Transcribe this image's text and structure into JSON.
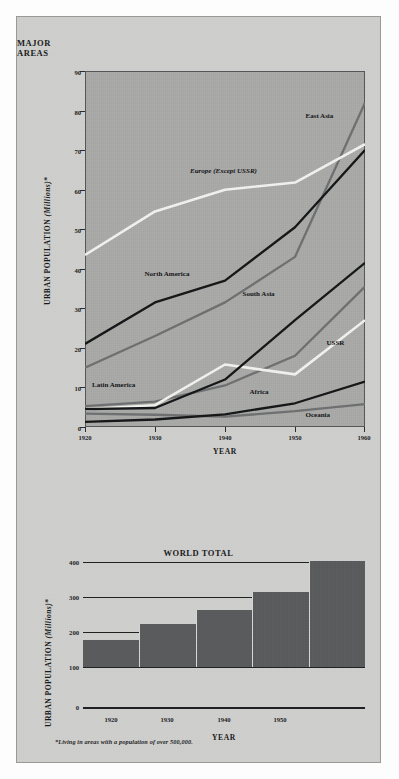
{
  "figure": {
    "footnote": "*Living in areas with a population of over 500,000.",
    "plate_color": "#cfcfcd",
    "plot_color": "#a9a9a7",
    "bar_color": "#585a5c"
  },
  "chart_data": [
    {
      "type": "line",
      "title": "MAJOR AREAS",
      "xlabel": "YEAR",
      "ylabel": "URBAN POPULATION (Millions)*",
      "x": [
        1920,
        1930,
        1940,
        1950,
        1960
      ],
      "xticklabels": [
        "1920",
        "1930",
        "1940",
        "1950",
        "1960"
      ],
      "xlim": [
        1920,
        1960
      ],
      "ylim": [
        0,
        90
      ],
      "yticks": [
        0,
        10,
        20,
        30,
        40,
        50,
        60,
        70,
        80,
        90
      ],
      "yticklabels": [
        "0",
        "10",
        "20",
        "30",
        "40",
        "50",
        "60",
        "70",
        "80",
        "90"
      ],
      "grid": false,
      "legend": "inline-annotations",
      "series": [
        {
          "name": "Europe (Except USSR)",
          "color": "#f2f2ee",
          "style": "white",
          "values": [
            43.5,
            54.5,
            60.0,
            61.8,
            71.5
          ]
        },
        {
          "name": "East Asia",
          "color": "#6e6f71",
          "style": "gray",
          "values": [
            15.0,
            23.0,
            31.5,
            43.0,
            82.0
          ]
        },
        {
          "name": "North America",
          "color": "#141517",
          "style": "black",
          "values": [
            21.0,
            31.5,
            37.0,
            50.5,
            70.0
          ]
        },
        {
          "name": "South Asia",
          "color": "#141517",
          "style": "black",
          "values": [
            4.5,
            4.8,
            12.0,
            27.0,
            41.5
          ]
        },
        {
          "name": "USSR",
          "color": "#f2f2ee",
          "style": "white",
          "values": [
            4.5,
            5.5,
            15.8,
            13.3,
            27.0
          ]
        },
        {
          "name": "Latin America",
          "color": "#6e6f71",
          "style": "gray",
          "values": [
            5.3,
            6.4,
            10.5,
            18.0,
            35.5
          ]
        },
        {
          "name": "Africa",
          "color": "#141517",
          "style": "black",
          "values": [
            1.3,
            1.9,
            3.2,
            6.0,
            11.5
          ]
        },
        {
          "name": "Oceania",
          "color": "#6e6f71",
          "style": "gray",
          "values": [
            3.4,
            3.1,
            2.6,
            4.0,
            5.8
          ]
        }
      ],
      "annotations": [
        {
          "text": "East Asia",
          "x": 1951.5,
          "y": 78.5,
          "italic": false
        },
        {
          "text": "Europe (Except USSR)",
          "x": 1935.0,
          "y": 64.5,
          "italic": true
        },
        {
          "text": "North America",
          "x": 1928.5,
          "y": 38.5,
          "italic": false
        },
        {
          "text": "South Asia",
          "x": 1942.5,
          "y": 33.5,
          "italic": false
        },
        {
          "text": "USSR",
          "x": 1954.5,
          "y": 21.0,
          "italic": false
        },
        {
          "text": "Latin America",
          "x": 1921.0,
          "y": 10.5,
          "italic": false
        },
        {
          "text": "Africa",
          "x": 1943.5,
          "y": 8.5,
          "italic": false
        },
        {
          "text": "Oceania",
          "x": 1951.5,
          "y": 2.8,
          "italic": false
        }
      ]
    },
    {
      "type": "bar",
      "title": "WORLD TOTAL",
      "xlabel": "YEAR",
      "ylabel": "URBAN POPULATION (Millions)*",
      "categories": [
        "1920",
        "1930",
        "1940",
        "1950",
        "1960"
      ],
      "xticklabels": [
        "1920",
        "1930",
        "1940",
        "1950"
      ],
      "values": [
        178,
        222,
        263,
        313,
        403
      ],
      "ylim": [
        0,
        400
      ],
      "yticks": [
        0,
        100,
        200,
        300,
        400
      ],
      "yticklabels": [
        "0",
        "100",
        "200",
        "300",
        "400"
      ],
      "bar_base": 100,
      "grid": true
    }
  ]
}
